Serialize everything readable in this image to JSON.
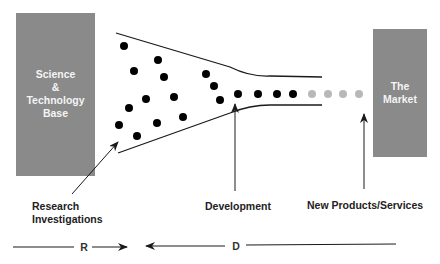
{
  "colors": {
    "box_fill": "#8a8a8a",
    "line": "#1a1a1a",
    "dot_active": "#000000",
    "dot_future": "#b8b8b8",
    "box_text": "#f4f4f4",
    "caption_text": "#222222"
  },
  "left_box": {
    "label_lines": [
      "Science",
      "&",
      "Technology",
      "Base"
    ]
  },
  "right_box": {
    "label_lines": [
      "The",
      "Market"
    ]
  },
  "captions": {
    "research": [
      "Research",
      "Investigations"
    ],
    "development": "Development",
    "products": "New Products/Services"
  },
  "axis": {
    "r_label": "R",
    "d_label": "D"
  },
  "funnel": {
    "black_dots": [
      [
        124,
        46
      ],
      [
        158,
        60
      ],
      [
        134,
        71
      ],
      [
        164,
        77
      ],
      [
        206,
        74
      ],
      [
        214,
        86
      ],
      [
        146,
        99
      ],
      [
        174,
        97
      ],
      [
        129,
        108
      ],
      [
        220,
        100
      ],
      [
        119,
        125
      ],
      [
        157,
        123
      ],
      [
        183,
        117
      ],
      [
        137,
        136
      ],
      [
        238,
        94
      ],
      [
        258,
        94
      ],
      [
        277,
        94
      ],
      [
        293,
        94
      ]
    ],
    "gray_dots": [
      [
        312,
        94
      ],
      [
        328,
        94
      ],
      [
        343,
        94
      ],
      [
        359,
        94
      ]
    ]
  }
}
